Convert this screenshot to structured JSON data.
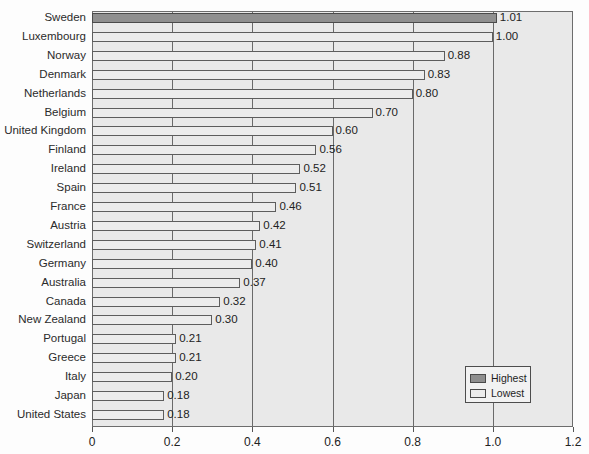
{
  "chart_data": {
    "type": "bar",
    "orientation": "horizontal",
    "title": "",
    "subtitle": "",
    "xlabel": "",
    "ylabel": "",
    "xlim": [
      0,
      1.2
    ],
    "xticks": [
      "0",
      "0.2",
      "0.4",
      "0.6",
      "0.8",
      "1.0",
      "1.2"
    ],
    "xtick_values": [
      0,
      0.2,
      0.4,
      0.6,
      0.8,
      1.0,
      1.2
    ],
    "grid": "vertical",
    "legend_position": "inner-lower-right",
    "categories": [
      "Sweden",
      "Luxembourg",
      "Norway",
      "Denmark",
      "Netherlands",
      "Belgium",
      "United Kingdom",
      "Finland",
      "Ireland",
      "Spain",
      "France",
      "Austria",
      "Switzerland",
      "Germany",
      "Australia",
      "Canada",
      "New Zealand",
      "Portugal",
      "Greece",
      "Italy",
      "Japan",
      "United States"
    ],
    "values": [
      1.01,
      1.0,
      0.88,
      0.83,
      0.8,
      0.7,
      0.6,
      0.56,
      0.52,
      0.51,
      0.46,
      0.42,
      0.41,
      0.4,
      0.37,
      0.32,
      0.3,
      0.21,
      0.21,
      0.2,
      0.18,
      0.18
    ],
    "value_labels": [
      "1.01",
      "1.00",
      "0.88",
      "0.83",
      "0.80",
      "0.70",
      "0.60",
      "0.56",
      "0.52",
      "0.51",
      "0.46",
      "0.42",
      "0.41",
      "0.40",
      "0.37",
      "0.32",
      "0.30",
      "0.21",
      "0.21",
      "0.20",
      "0.18",
      "0.18"
    ],
    "series_class": [
      "highest",
      "lowest",
      "lowest",
      "lowest",
      "lowest",
      "lowest",
      "lowest",
      "lowest",
      "lowest",
      "lowest",
      "lowest",
      "lowest",
      "lowest",
      "lowest",
      "lowest",
      "lowest",
      "lowest",
      "lowest",
      "lowest",
      "lowest",
      "lowest",
      "lowest"
    ],
    "legend": [
      {
        "label": "Highest",
        "swatch": "highest",
        "color": "#8f8f8f"
      },
      {
        "label": "Lowest",
        "swatch": "lowest",
        "color": "#ececec"
      }
    ]
  },
  "colors": {
    "plot_background": "#e9e9e9",
    "page_background": "#fdfdfd",
    "bar_highest": "#8f8f8f",
    "bar_lowest": "#ececec",
    "bar_border": "#5d5d5d",
    "gridline": "#6a6a6a",
    "axis": "#555555",
    "text": "#222222"
  }
}
